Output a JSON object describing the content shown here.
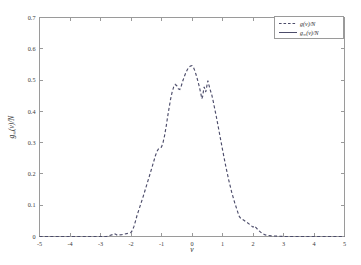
{
  "figure": {
    "background_color": "#ffffff",
    "frame_color": "#9a9a9a",
    "series_color": "#4c4c6a"
  },
  "chart_data": {
    "type": "line",
    "title": "",
    "xlabel": "v",
    "ylabel": "g∞(v)/N",
    "xlim": [
      -5,
      5
    ],
    "ylim": [
      0,
      0.7
    ],
    "grid": false,
    "legend_position": "top-right",
    "xticks": [
      -5,
      -4,
      -3,
      -2,
      -1,
      0,
      1,
      2,
      3,
      4,
      5
    ],
    "xtick_labels": [
      "-5",
      "-4",
      "-3",
      "-2",
      "-1",
      "0",
      "1",
      "2",
      "3",
      "4",
      "5"
    ],
    "yticks": [
      0,
      0.1,
      0.2,
      0.3,
      0.4,
      0.5,
      0.6,
      0.7
    ],
    "ytick_labels": [
      "0",
      "0.1",
      "0.2",
      "0.3",
      "0.4",
      "0.5",
      "0.6",
      "0.7"
    ],
    "series": [
      {
        "name": "g(v)/N",
        "style": "dashed",
        "color": "#4c4c6a",
        "x": [
          -5.0,
          -4.8,
          -4.6,
          -4.4,
          -4.2,
          -4.0,
          -3.8,
          -3.6,
          -3.4,
          -3.2,
          -3.0,
          -2.9,
          -2.8,
          -2.7,
          -2.6,
          -2.55,
          -2.5,
          -2.45,
          -2.4,
          -2.3,
          -2.2,
          -2.1,
          -2.0,
          -1.95,
          -1.9,
          -1.85,
          -1.8,
          -1.7,
          -1.6,
          -1.5,
          -1.4,
          -1.3,
          -1.2,
          -1.15,
          -1.1,
          -1.05,
          -1.0,
          -0.95,
          -0.9,
          -0.85,
          -0.8,
          -0.75,
          -0.7,
          -0.65,
          -0.6,
          -0.55,
          -0.5,
          -0.45,
          -0.4,
          -0.35,
          -0.3,
          -0.25,
          -0.2,
          -0.15,
          -0.1,
          -0.05,
          0.0,
          0.05,
          0.1,
          0.15,
          0.2,
          0.25,
          0.3,
          0.32,
          0.35,
          0.38,
          0.4,
          0.45,
          0.5,
          0.52,
          0.55,
          0.6,
          0.65,
          0.7,
          0.8,
          0.9,
          1.0,
          1.1,
          1.2,
          1.3,
          1.4,
          1.5,
          1.55,
          1.6,
          1.65,
          1.7,
          1.8,
          1.9,
          2.0,
          2.05,
          2.1,
          2.2,
          2.3,
          2.4,
          2.6,
          2.8,
          3.0,
          3.3,
          3.6,
          4.0,
          4.4,
          4.8,
          5.0
        ],
        "y": [
          0.0,
          0.0,
          0.0,
          0.0,
          0.0,
          0.0,
          0.0,
          0.0,
          0.0,
          0.0,
          0.0,
          0.0,
          0.0,
          0.003,
          0.006,
          0.009,
          0.007,
          0.004,
          0.005,
          0.006,
          0.008,
          0.01,
          0.013,
          0.02,
          0.033,
          0.05,
          0.068,
          0.098,
          0.128,
          0.16,
          0.192,
          0.225,
          0.258,
          0.272,
          0.28,
          0.283,
          0.286,
          0.3,
          0.322,
          0.35,
          0.382,
          0.412,
          0.44,
          0.462,
          0.478,
          0.486,
          0.482,
          0.472,
          0.47,
          0.482,
          0.498,
          0.512,
          0.524,
          0.534,
          0.541,
          0.545,
          0.546,
          0.54,
          0.528,
          0.512,
          0.494,
          0.474,
          0.452,
          0.44,
          0.448,
          0.468,
          0.478,
          0.462,
          0.488,
          0.498,
          0.486,
          0.468,
          0.452,
          0.43,
          0.382,
          0.33,
          0.278,
          0.228,
          0.182,
          0.142,
          0.108,
          0.078,
          0.064,
          0.058,
          0.055,
          0.052,
          0.045,
          0.038,
          0.03,
          0.034,
          0.028,
          0.018,
          0.01,
          0.005,
          0.002,
          0.001,
          0.0,
          0.0,
          0.0,
          0.0,
          0.0,
          0.0,
          0.0
        ]
      },
      {
        "name": "g∞(v)/N",
        "style": "solid",
        "color": "#4c4c6a",
        "x": [],
        "y": []
      }
    ],
    "legend_entries": [
      {
        "label": "g(v)/N",
        "style": "dashed"
      },
      {
        "label": "g∞(v)/N",
        "style": "solid"
      }
    ]
  },
  "labels": {
    "xlabel": "v",
    "ylabel_g": "g",
    "ylabel_sub": "∞",
    "ylabel_rest": "(v)/N",
    "legend_1_g": "g",
    "legend_1_rest": "(v)/N",
    "legend_2_g": "g",
    "legend_2_sub": "∞",
    "legend_2_rest": "(v)/N"
  }
}
